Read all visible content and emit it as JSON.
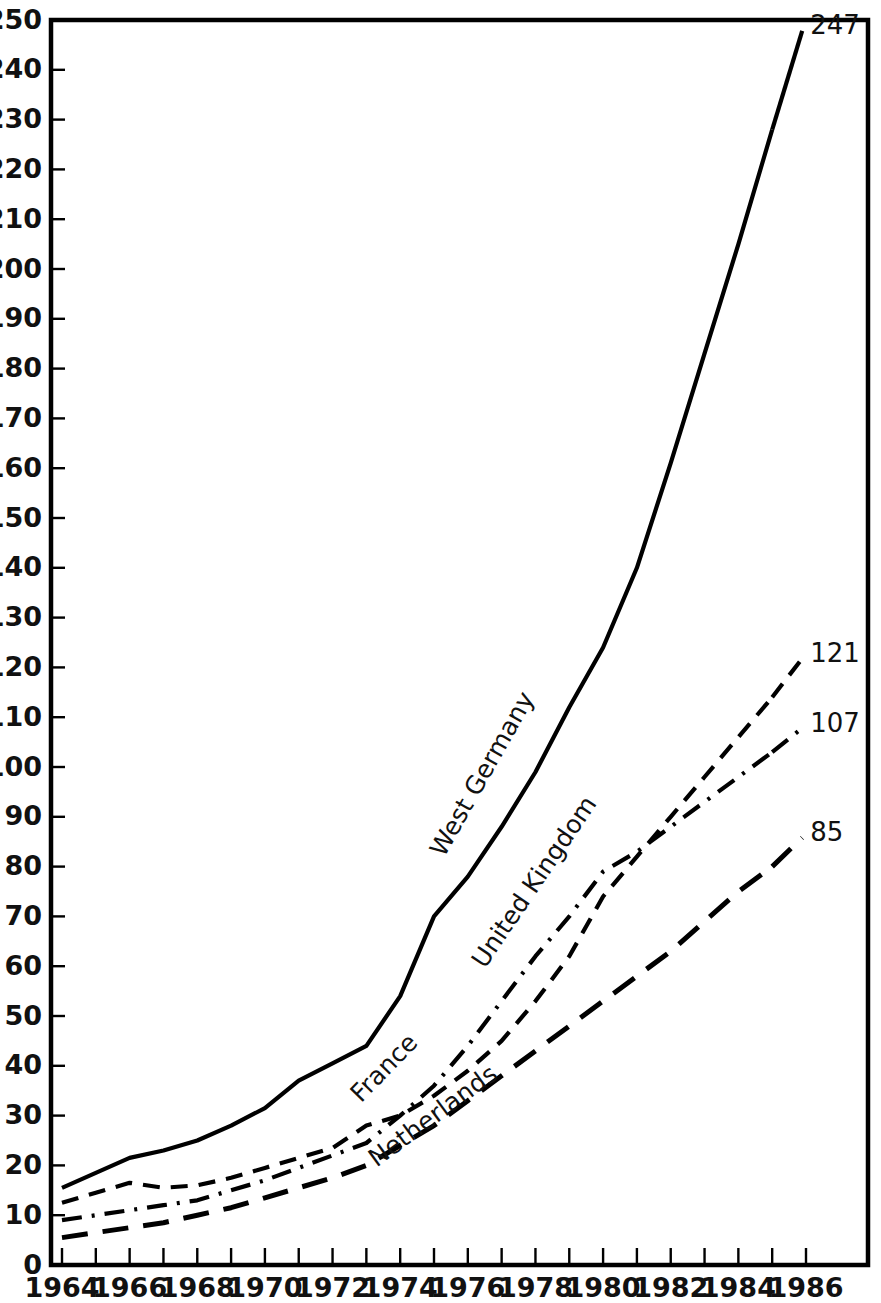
{
  "chart_data": {
    "type": "line",
    "title": "",
    "subtitle": "",
    "xlabel": "",
    "ylabel": "",
    "xlim": [
      1964,
      1986
    ],
    "ylim": [
      0,
      250
    ],
    "grid": false,
    "legend_position": "inline-labels",
    "y_ticks": [
      0,
      10,
      20,
      30,
      40,
      50,
      60,
      70,
      80,
      90,
      100,
      110,
      120,
      130,
      140,
      150,
      160,
      170,
      180,
      190,
      200,
      210,
      220,
      230,
      240,
      250
    ],
    "y_tick_labels": [
      "0",
      "10",
      "20",
      "30",
      "40",
      "50",
      "60",
      "70",
      "80",
      "90",
      "100",
      "110",
      "120",
      "130",
      "140",
      "150",
      "160",
      "170",
      "180",
      "190",
      "200",
      "210",
      "220",
      "230",
      "240",
      "250"
    ],
    "x_ticks": [
      1964,
      1965,
      1966,
      1967,
      1968,
      1969,
      1970,
      1971,
      1972,
      1973,
      1974,
      1975,
      1976,
      1977,
      1978,
      1979,
      1980,
      1981,
      1982,
      1983,
      1984,
      1985,
      1986
    ],
    "x_tick_labels": [
      "1964",
      "",
      "1966",
      "",
      "1968",
      "",
      "1970",
      "",
      "1972",
      "",
      "1974",
      "",
      "1976",
      "",
      "1978",
      "",
      "1980",
      "",
      "1982",
      "",
      "1984",
      "",
      "1986"
    ],
    "x": [
      1964,
      1965,
      1966,
      1967,
      1968,
      1969,
      1970,
      1971,
      1972,
      1973,
      1974,
      1975,
      1976,
      1977,
      1978,
      1979,
      1980,
      1981,
      1982,
      1983,
      1984,
      1985
    ],
    "series": [
      {
        "name": "West Germany",
        "style": "solid",
        "end_value": 247,
        "end_label": "247",
        "values": [
          15.5,
          18.5,
          21.5,
          23,
          25,
          28,
          31.5,
          37,
          40.5,
          44,
          54,
          70,
          78,
          88,
          99,
          112,
          124,
          140,
          161,
          183,
          205,
          228
        ]
      },
      {
        "name": "United Kingdom",
        "style": "dashed",
        "end_value": 121,
        "end_label": "121",
        "values": [
          12.5,
          14.5,
          16.5,
          15.5,
          16,
          17.5,
          19.5,
          21.5,
          23.5,
          28,
          30,
          34,
          39,
          45,
          53,
          62,
          74,
          82,
          90,
          98,
          106,
          114
        ]
      },
      {
        "name": "France",
        "style": "dash-dot",
        "end_value": 107,
        "end_label": "107",
        "values": [
          9,
          10,
          11,
          12,
          13,
          15,
          17,
          19.5,
          22,
          24.5,
          30,
          36,
          44,
          53,
          62,
          70,
          79,
          83,
          88,
          93,
          98,
          103
        ]
      },
      {
        "name": "Netherlands",
        "style": "long-dash",
        "end_value": 85,
        "end_label": "85",
        "values": [
          5.5,
          6.5,
          7.5,
          8.5,
          10,
          11.5,
          13.5,
          15.5,
          17.5,
          20,
          24,
          28,
          33,
          38,
          43,
          48,
          53,
          58,
          63,
          69,
          75,
          80
        ]
      }
    ]
  },
  "annotations": {
    "series_labels": [
      {
        "text": "West Germany",
        "series": "West Germany"
      },
      {
        "text": "United Kingdom",
        "series": "United Kingdom"
      },
      {
        "text": "France",
        "series": "France"
      },
      {
        "text": "Netherlands",
        "series": "Netherlands"
      }
    ]
  },
  "colors": {
    "ink": "#000000",
    "background": "#ffffff",
    "text": "#111111"
  }
}
